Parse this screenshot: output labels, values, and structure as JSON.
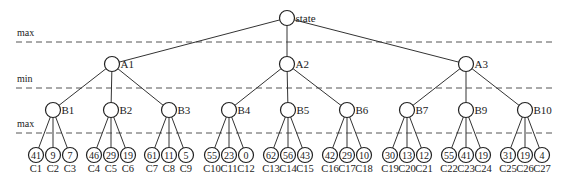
{
  "diagram": {
    "type": "minimax-game-tree",
    "levels": [
      {
        "label": "max",
        "line_y": 42,
        "label_y": 36
      },
      {
        "label": "min",
        "line_y": 88,
        "label_y": 82
      },
      {
        "label": "max",
        "line_y": 133,
        "label_y": 127
      }
    ],
    "root": {
      "id": "state",
      "label": "state",
      "x": 287,
      "y": 18
    },
    "level_a": [
      {
        "id": "A1",
        "label": "A1",
        "x": 112,
        "y": 64
      },
      {
        "id": "A2",
        "label": "A2",
        "x": 287,
        "y": 64
      },
      {
        "id": "A3",
        "label": "A3",
        "x": 466,
        "y": 64
      }
    ],
    "level_b": [
      {
        "id": "B1",
        "label": "B1",
        "parent": "A1",
        "x": 53,
        "y": 110
      },
      {
        "id": "B2",
        "label": "B2",
        "parent": "A1",
        "x": 111,
        "y": 110
      },
      {
        "id": "B3",
        "label": "B3",
        "parent": "A1",
        "x": 169,
        "y": 110
      },
      {
        "id": "B4",
        "label": "B4",
        "parent": "A2",
        "x": 229,
        "y": 110
      },
      {
        "id": "B5",
        "label": "B5",
        "parent": "A2",
        "x": 288,
        "y": 110
      },
      {
        "id": "B6",
        "label": "B6",
        "parent": "A2",
        "x": 347,
        "y": 110
      },
      {
        "id": "B7",
        "label": "B7",
        "parent": "A3",
        "x": 407,
        "y": 110
      },
      {
        "id": "B9",
        "label": "B9",
        "parent": "A3",
        "x": 466,
        "y": 110
      },
      {
        "id": "B10",
        "label": "B10",
        "parent": "A3",
        "x": 525,
        "y": 110
      }
    ],
    "leaves": [
      {
        "id": "C1",
        "value": "41",
        "parent": "B1"
      },
      {
        "id": "C2",
        "value": "9",
        "parent": "B1"
      },
      {
        "id": "C3",
        "value": "7",
        "parent": "B1"
      },
      {
        "id": "C4",
        "value": "46",
        "parent": "B2"
      },
      {
        "id": "C5",
        "value": "29",
        "parent": "B2"
      },
      {
        "id": "C6",
        "value": "19",
        "parent": "B2"
      },
      {
        "id": "C7",
        "value": "61",
        "parent": "B3"
      },
      {
        "id": "C8",
        "value": "11",
        "parent": "B3"
      },
      {
        "id": "C9",
        "value": "5",
        "parent": "B3"
      },
      {
        "id": "C10",
        "value": "55",
        "parent": "B4"
      },
      {
        "id": "C11",
        "value": "23",
        "parent": "B4"
      },
      {
        "id": "C12",
        "value": "0",
        "parent": "B4"
      },
      {
        "id": "C13",
        "value": "62",
        "parent": "B5"
      },
      {
        "id": "C14",
        "value": "56",
        "parent": "B5"
      },
      {
        "id": "C15",
        "value": "43",
        "parent": "B5"
      },
      {
        "id": "C16",
        "value": "42",
        "parent": "B6"
      },
      {
        "id": "C17",
        "value": "29",
        "parent": "B6"
      },
      {
        "id": "C18",
        "value": "10",
        "parent": "B6"
      },
      {
        "id": "C19",
        "value": "30",
        "parent": "B7"
      },
      {
        "id": "C20",
        "value": "13",
        "parent": "B7"
      },
      {
        "id": "C21",
        "value": "12",
        "parent": "B7"
      },
      {
        "id": "C22",
        "value": "55",
        "parent": "B9"
      },
      {
        "id": "C23",
        "value": "41",
        "parent": "B9"
      },
      {
        "id": "C24",
        "value": "19",
        "parent": "B9"
      },
      {
        "id": "C25",
        "value": "31",
        "parent": "B10"
      },
      {
        "id": "C26",
        "value": "19",
        "parent": "B10"
      },
      {
        "id": "C27",
        "value": "4",
        "parent": "B10"
      }
    ],
    "leaf_spacing": 17,
    "leaf_y": 155,
    "leaf_label_y": 172
  }
}
